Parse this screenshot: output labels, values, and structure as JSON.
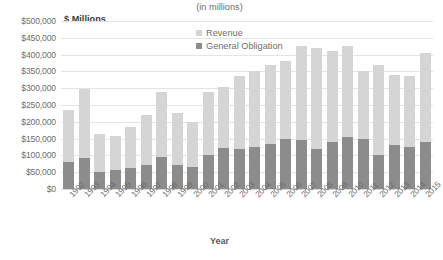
{
  "chart_data": {
    "type": "bar",
    "stacked": true,
    "title": "(in millions)",
    "xlabel": "Year",
    "ylabel": "$ Millions",
    "ylim": [
      0,
      500000
    ],
    "ytick_step": 50000,
    "ytick_labels": [
      "$500,000",
      "$450,000",
      "$400,000",
      "$350,000",
      "$300,000",
      "$250,000",
      "$200,000",
      "$150,000",
      "$100,000",
      "$50,000",
      "$0"
    ],
    "grid": true,
    "legend_position": "inside-top-center",
    "categories": [
      "1992",
      "1993",
      "1994",
      "1995",
      "1996",
      "1997",
      "1998",
      "1999",
      "2000",
      "2001",
      "2002",
      "2003",
      "2004",
      "2005",
      "2006",
      "2007",
      "2008",
      "2009",
      "2010",
      "2011",
      "2012",
      "2013",
      "2014",
      "2015"
    ],
    "series": [
      {
        "name": "General Obligation",
        "color": "#8c8c8c",
        "values": [
          80000,
          92000,
          52000,
          58000,
          64000,
          72000,
          95000,
          70000,
          66000,
          100000,
          122000,
          120000,
          125000,
          135000,
          150000,
          145000,
          120000,
          140000,
          155000,
          150000,
          100000,
          130000,
          125000,
          140000
        ]
      },
      {
        "name": "Revenue",
        "color": "#d5d5d5",
        "values": [
          155000,
          205000,
          113000,
          100000,
          120000,
          148000,
          195000,
          155000,
          134000,
          190000,
          183000,
          215000,
          225000,
          235000,
          230000,
          280000,
          300000,
          270000,
          270000,
          200000,
          270000,
          210000,
          210000,
          265000
        ]
      }
    ],
    "totals": [
      235000,
      297000,
      165000,
      158000,
      184000,
      220000,
      290000,
      225000,
      200000,
      290000,
      305000,
      335000,
      350000,
      370000,
      380000,
      425000,
      420000,
      410000,
      425000,
      350000,
      370000,
      340000,
      335000,
      405000
    ]
  },
  "labels": {
    "chart_title": "(in millions)",
    "y_axis_title": "$ Millions",
    "x_axis_title": "Year"
  },
  "legend": {
    "items": [
      {
        "label": "Revenue",
        "color": "#d5d5d5"
      },
      {
        "label": "General Obligation",
        "color": "#8c8c8c"
      }
    ]
  }
}
